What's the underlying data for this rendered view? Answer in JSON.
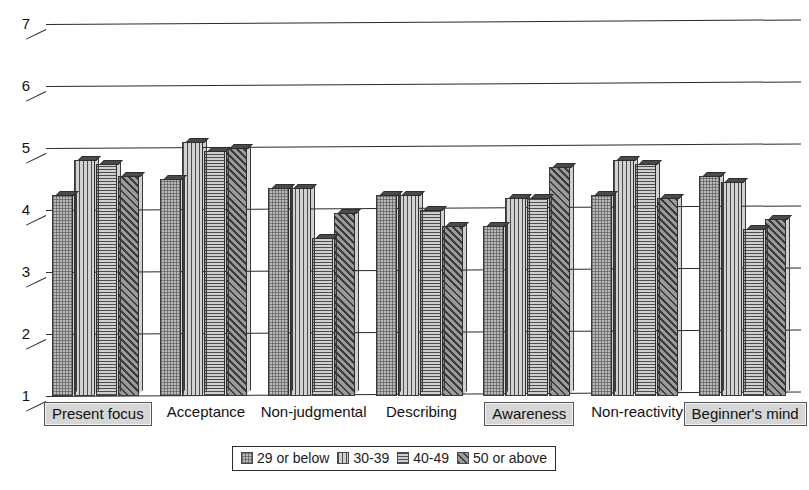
{
  "chart_data": {
    "type": "bar",
    "title": "",
    "subtitle": "",
    "xlabel": "",
    "ylabel": "",
    "ylim": [
      1,
      7
    ],
    "yticks": [
      1,
      2,
      3,
      4,
      5,
      6,
      7
    ],
    "grid": true,
    "legend_position": "bottom",
    "style": "3d-grouped-bar-grayscale",
    "categories": [
      "Present focus",
      "Acceptance",
      "Non-judgmental",
      "Describing",
      "Awareness",
      "Non-reactivity",
      "Beginner's mind"
    ],
    "highlighted_categories": [
      "Present focus",
      "Awareness",
      "Beginner's mind"
    ],
    "series": [
      {
        "name": "29 or below",
        "values": [
          4.25,
          4.5,
          4.35,
          4.25,
          3.75,
          4.25,
          4.55
        ]
      },
      {
        "name": "30-39",
        "values": [
          4.8,
          5.1,
          4.35,
          4.25,
          4.2,
          4.8,
          4.45
        ]
      },
      {
        "name": "40-49",
        "values": [
          4.75,
          4.95,
          3.55,
          4.0,
          4.2,
          4.75,
          3.7
        ]
      },
      {
        "name": "50 or above",
        "values": [
          4.55,
          5.0,
          3.95,
          3.75,
          4.7,
          4.2,
          3.85
        ]
      }
    ]
  },
  "legend": {
    "items": [
      {
        "label": "29 or below",
        "swatch": "checker-light"
      },
      {
        "label": "30-39",
        "swatch": "vertical-lines"
      },
      {
        "label": "40-49",
        "swatch": "horizontal-lines"
      },
      {
        "label": "50 or above",
        "swatch": "diagonal-dark"
      }
    ]
  },
  "axis": {
    "y_labels": [
      "7",
      "6",
      "5",
      "4",
      "3",
      "2",
      "1"
    ]
  },
  "colors": {
    "background": "#ffffff",
    "ink": "#1b1b1b",
    "grid": "#2b2b2b",
    "series_29_or_below": "#b9b9b9",
    "series_30_39": "#d2d2d2",
    "series_40_49": "#cfcfcf",
    "series_50_or_above": "#9a9a9a",
    "highlight_box_fill": "#d6d6d6"
  }
}
